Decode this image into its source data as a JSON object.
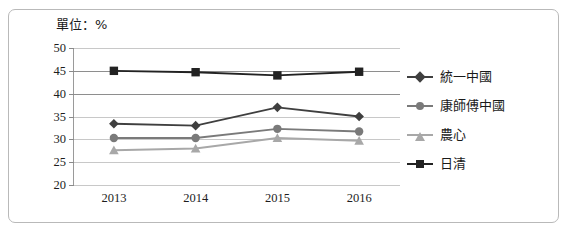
{
  "unit_caption": "單位：%",
  "chart_data": {
    "type": "line",
    "title": "",
    "xlabel": "",
    "ylabel": "",
    "unit": "%",
    "categories": [
      "2013",
      "2014",
      "2015",
      "2016"
    ],
    "x": [
      2013,
      2014,
      2015,
      2016
    ],
    "ylim": [
      20,
      50
    ],
    "yticks": [
      20,
      25,
      30,
      35,
      40,
      45,
      50
    ],
    "ytick_labels": [
      "20",
      "25",
      "30",
      "35",
      "40",
      "45",
      "50"
    ],
    "grid": true,
    "legend_position": "right",
    "series": [
      {
        "name": "統一中國",
        "marker": "diamond",
        "color": "#3f3f3f",
        "values": [
          33.4,
          33.0,
          37.0,
          35.0
        ]
      },
      {
        "name": "康師傅中國",
        "marker": "circle",
        "color": "#7a7a7a",
        "values": [
          30.3,
          30.3,
          32.3,
          31.7
        ]
      },
      {
        "name": "農心",
        "marker": "triangle",
        "color": "#a8a8a8",
        "values": [
          27.6,
          28.0,
          30.3,
          29.7
        ]
      },
      {
        "name": "日清",
        "marker": "square",
        "color": "#222222",
        "values": [
          45.0,
          44.7,
          44.0,
          44.8
        ]
      }
    ]
  },
  "legend": {
    "items": [
      {
        "label": "統一中國"
      },
      {
        "label": "康師傅中國"
      },
      {
        "label": "農心"
      },
      {
        "label": "日清"
      }
    ]
  },
  "axis": {
    "y_labels": [
      "50",
      "45",
      "40",
      "35",
      "30",
      "25",
      "20"
    ],
    "x_labels": [
      "2013",
      "2014",
      "2015",
      "2016"
    ]
  },
  "colors": {
    "frame": "#b9b9b9",
    "grid": "#c8c8c8",
    "grid_strong": "#8e8e8e",
    "axis": "#9a9a9a",
    "text": "#1a1a1a"
  }
}
